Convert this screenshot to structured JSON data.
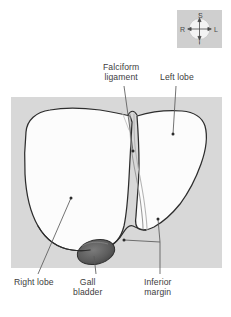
{
  "figure": {
    "background_color": "#ffffff",
    "panel_color": "#d7d7d7",
    "organ_fill": "#fbfbfb",
    "outline_color": "#2e2e2e",
    "gallbladder_color": "#5a5a5a",
    "ligament_color": "#8c8c8c",
    "leader_color": "#5c5c5c",
    "text_color": "#3d3d3d"
  },
  "labels": {
    "falciform_ligament": {
      "line1": "Falciform",
      "line2": "ligament"
    },
    "left_lobe": {
      "line1": "Left lobe"
    },
    "right_lobe": {
      "line1": "Right lobe"
    },
    "gall_bladder": {
      "line1": "Gall",
      "line2": "bladder"
    },
    "inferior_margin": {
      "line1": "Inferior",
      "line2": "margin"
    }
  },
  "orientation_compass": {
    "superior": "S",
    "inferior": "I",
    "right": "R",
    "left": "L",
    "box_color": "#cfcfcf",
    "disc_color": "#f2f2f2"
  }
}
